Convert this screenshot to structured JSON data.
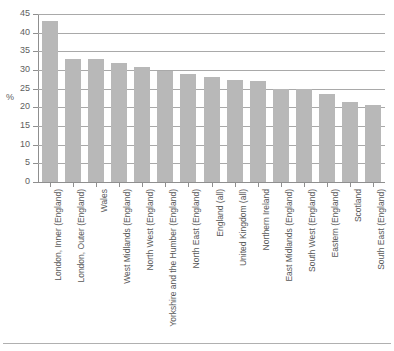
{
  "chart_data": {
    "type": "bar",
    "title": "",
    "subtitle": "",
    "xlabel": "",
    "ylabel": "%",
    "ylim": [
      0,
      45
    ],
    "ytick_step": 5,
    "yticks": [
      45,
      40,
      35,
      30,
      25,
      20,
      15,
      10,
      5,
      0
    ],
    "grid": true,
    "legend": "none",
    "orientation": "vertical",
    "bar_color": "#b8b8b8",
    "grid_color": "#a9a9a9",
    "axis_color": "#8f8f8f",
    "categories": [
      "London, Inner (England)",
      "London, Outer (England)",
      "Wales",
      "West Midlands (England)",
      "North West (England)",
      "Yorkshire and the Humber (England)",
      "North East (England)",
      "England (all)",
      "United Kingdom (all)",
      "Northern Ireland",
      "East Midlands (England)",
      "South West (England)",
      "Eastern (England)",
      "Scotland",
      "South East (England)"
    ],
    "values": [
      43.0,
      33.0,
      33.0,
      32.0,
      30.8,
      29.8,
      28.8,
      28.0,
      27.3,
      27.0,
      25.0,
      25.0,
      23.5,
      21.5,
      20.5
    ]
  },
  "axis": {
    "y_title": "%"
  }
}
